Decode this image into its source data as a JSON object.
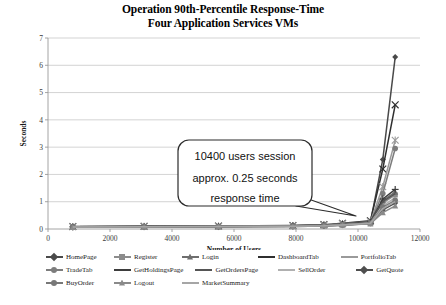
{
  "title": {
    "line1": "Operation 90th-Percentile Response-Time",
    "line2": "Four Application Services VMs"
  },
  "annotation": {
    "name": "callout-box",
    "line1": "10400 users session",
    "line2": "approx. 0.25 seconds",
    "line3": "response time"
  },
  "chart_data": {
    "type": "line",
    "title": "Operation 90th-Percentile Response-Time Four Application Services VMs",
    "xlabel": "Number of Users",
    "ylabel": "Seconds",
    "xlim": [
      0,
      12000
    ],
    "ylim": [
      0,
      7
    ],
    "xticks": [
      0,
      2000,
      4000,
      6000,
      8000,
      10000,
      12000
    ],
    "yticks": [
      0,
      1,
      2,
      3,
      4,
      5,
      6,
      7
    ],
    "xtick_labels": [
      "0",
      "2000",
      "4000",
      "6000",
      "8000",
      "10000",
      "12000"
    ],
    "ytick_labels": [
      "0",
      "1",
      "2",
      "3",
      "4",
      "5",
      "6",
      "7"
    ],
    "grid": "horizontal",
    "legend_position": "bottom",
    "x": [
      800,
      3100,
      5500,
      7900,
      8900,
      9500,
      10400,
      10800,
      11200
    ],
    "series": [
      {
        "name": "HomePage",
        "marker": "diamond",
        "color": "#4a4a4a",
        "values": [
          0.08,
          0.09,
          0.1,
          0.12,
          0.14,
          0.18,
          0.25,
          2.55,
          6.3
        ]
      },
      {
        "name": "Register",
        "marker": "square",
        "color": "#8c8c8c",
        "values": [
          0.07,
          0.08,
          0.09,
          0.11,
          0.13,
          0.16,
          0.22,
          0.95,
          1.25
        ]
      },
      {
        "name": "Login",
        "marker": "triangle",
        "color": "#6e6e6e",
        "values": [
          0.07,
          0.08,
          0.09,
          0.11,
          0.13,
          0.17,
          0.24,
          1.05,
          1.35
        ]
      },
      {
        "name": "DashboardTab",
        "marker": "cross",
        "color": "#2f2f2f",
        "values": [
          0.09,
          0.1,
          0.11,
          0.13,
          0.16,
          0.21,
          0.3,
          2.2,
          4.55
        ]
      },
      {
        "name": "PortfolioTab",
        "marker": "star",
        "color": "#9a9a9a",
        "values": [
          0.08,
          0.09,
          0.1,
          0.12,
          0.15,
          0.19,
          0.27,
          1.55,
          3.25
        ]
      },
      {
        "name": "TradeTab",
        "marker": "circle",
        "color": "#7d7d7d",
        "values": [
          0.07,
          0.08,
          0.09,
          0.11,
          0.13,
          0.17,
          0.24,
          1.3,
          2.95
        ]
      },
      {
        "name": "GetHoldingsPage",
        "marker": "plus",
        "color": "#3d3d3d",
        "values": [
          0.08,
          0.09,
          0.1,
          0.12,
          0.14,
          0.18,
          0.26,
          1.1,
          1.45
        ]
      },
      {
        "name": "GetOrdersPage",
        "marker": "line",
        "color": "#555555",
        "values": [
          0.08,
          0.09,
          0.1,
          0.12,
          0.14,
          0.18,
          0.25,
          1.0,
          1.3
        ]
      },
      {
        "name": "SellOrder",
        "marker": "line",
        "color": "#b0b0b0",
        "values": [
          0.07,
          0.08,
          0.09,
          0.1,
          0.12,
          0.16,
          0.22,
          0.85,
          1.15
        ]
      },
      {
        "name": "GetQuote",
        "marker": "diamond",
        "color": "#4f4f4f",
        "values": [
          0.06,
          0.07,
          0.08,
          0.09,
          0.11,
          0.14,
          0.2,
          0.7,
          0.95
        ]
      },
      {
        "name": "BuyOrder",
        "marker": "circle",
        "color": "#787878",
        "values": [
          0.07,
          0.08,
          0.09,
          0.1,
          0.12,
          0.15,
          0.21,
          0.8,
          1.05
        ]
      },
      {
        "name": "Logout",
        "marker": "triangle",
        "color": "#8a8a8a",
        "values": [
          0.06,
          0.07,
          0.08,
          0.09,
          0.11,
          0.14,
          0.19,
          0.6,
          0.85
        ]
      },
      {
        "name": "MarketSummary",
        "marker": "line",
        "color": "#a6a6a6",
        "values": [
          0.07,
          0.08,
          0.09,
          0.1,
          0.12,
          0.15,
          0.21,
          0.75,
          1.0
        ]
      }
    ]
  },
  "legend_rows": [
    [
      "HomePage",
      "Register",
      "Login",
      "DashboardTab",
      "PortfolioTab"
    ],
    [
      "TradeTab",
      "GetHoldingsPage",
      "GetOrdersPage",
      "SellOrder",
      "GetQuote"
    ],
    [
      "BuyOrder",
      "Logout",
      "MarketSummary"
    ]
  ]
}
